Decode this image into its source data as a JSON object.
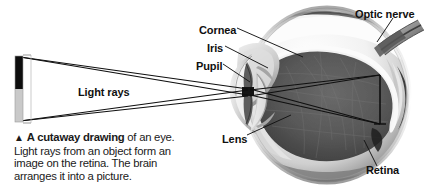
{
  "figure": {
    "title": "A cutaway drawing of an eye",
    "background_color": "#ffffff",
    "ink_color": "#101010"
  },
  "labels": {
    "light_rays": "Light rays",
    "cornea": "Cornea",
    "iris": "Iris",
    "pupil": "Pupil",
    "optic_nerve": "Optic nerve",
    "lens": "Lens",
    "retina": "Retina"
  },
  "caption": {
    "triangle": "▲",
    "lead": "A cutaway drawing",
    "rest": " of an eye. Light rays from an object form an image on the retina. The brain arranges it into a picture."
  },
  "object_bar": {
    "top_half_color": "#0d0d0d",
    "bottom_half_color": "#c9c9c9",
    "x": 15,
    "y": 56,
    "width": 8,
    "height": 66
  }
}
